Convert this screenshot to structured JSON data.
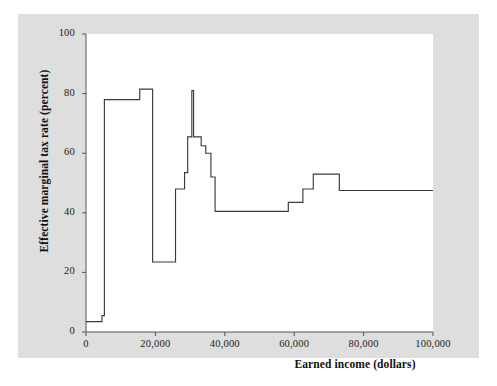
{
  "chart_data": {
    "type": "line",
    "title": "",
    "xlabel": "Earned income (dollars)",
    "ylabel": "Effective marginal tax rate (percent)",
    "xlim": [
      0,
      100000
    ],
    "ylim": [
      0,
      100
    ],
    "grid": false,
    "legend": null,
    "xticks": [
      0,
      20000,
      40000,
      60000,
      80000,
      100000
    ],
    "xtick_labels": [
      "0",
      "20,000",
      "40,000",
      "60,000",
      "80,000",
      "100,000"
    ],
    "yticks": [
      0,
      20,
      40,
      60,
      80,
      100
    ],
    "ytick_labels": [
      "0",
      "20",
      "40",
      "60",
      "80",
      "100"
    ],
    "line_color": "#3a3a3a",
    "panel_color": "#dedede",
    "plot_bg_color": "#ffffff",
    "step_style": "post",
    "series": [
      {
        "name": "Effective marginal tax rate",
        "x": [
          0,
          1500,
          4500,
          5000,
          7000,
          15500,
          16500,
          19000,
          19400,
          20000,
          25500,
          26000,
          27500,
          28000,
          29000,
          29400,
          30000,
          30400,
          31000,
          32000,
          33500,
          35000,
          36000,
          37500,
          38500,
          58500,
          59000,
          63500,
          65000,
          66000,
          73500,
          74500,
          76000,
          100000
        ],
        "y": [
          3.5,
          3.5,
          5.5,
          5.5,
          78,
          78,
          78,
          81.5,
          81.5,
          23.5,
          23.5,
          23.5,
          48,
          48,
          53.5,
          53.5,
          65.5,
          65.5,
          81,
          65.5,
          62.5,
          62.5,
          60,
          60,
          52,
          40.5,
          40.5,
          40.5,
          43.5,
          43.5,
          48,
          53,
          53,
          47.5
        ],
        "points": [
          {
            "x": 0,
            "y": 3.5
          },
          {
            "x": 4600,
            "y": 3.5
          },
          {
            "x": 4600,
            "y": 5.5
          },
          {
            "x": 5300,
            "y": 5.5
          },
          {
            "x": 5300,
            "y": 78
          },
          {
            "x": 15500,
            "y": 78
          },
          {
            "x": 15500,
            "y": 81.5
          },
          {
            "x": 19200,
            "y": 81.5
          },
          {
            "x": 19200,
            "y": 23.5
          },
          {
            "x": 25800,
            "y": 23.5
          },
          {
            "x": 25800,
            "y": 48
          },
          {
            "x": 28400,
            "y": 48
          },
          {
            "x": 28400,
            "y": 53.5
          },
          {
            "x": 29300,
            "y": 53.5
          },
          {
            "x": 29300,
            "y": 65.5
          },
          {
            "x": 30500,
            "y": 65.5
          },
          {
            "x": 30500,
            "y": 81
          },
          {
            "x": 31000,
            "y": 81
          },
          {
            "x": 31000,
            "y": 65.5
          },
          {
            "x": 33200,
            "y": 65.5
          },
          {
            "x": 33200,
            "y": 62.5
          },
          {
            "x": 34500,
            "y": 62.5
          },
          {
            "x": 34500,
            "y": 60
          },
          {
            "x": 36000,
            "y": 60
          },
          {
            "x": 36000,
            "y": 52
          },
          {
            "x": 37200,
            "y": 52
          },
          {
            "x": 37200,
            "y": 40.5
          },
          {
            "x": 58300,
            "y": 40.5
          },
          {
            "x": 58300,
            "y": 43.5
          },
          {
            "x": 62500,
            "y": 43.5
          },
          {
            "x": 62500,
            "y": 48
          },
          {
            "x": 65500,
            "y": 48
          },
          {
            "x": 65500,
            "y": 53
          },
          {
            "x": 73000,
            "y": 53
          },
          {
            "x": 73000,
            "y": 47.5
          },
          {
            "x": 100000,
            "y": 47.5
          }
        ]
      }
    ]
  }
}
